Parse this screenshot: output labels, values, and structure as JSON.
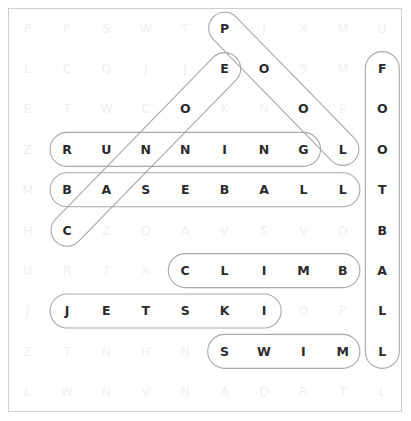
{
  "puzzle": {
    "type": "word-search",
    "rows": 10,
    "cols": 10,
    "grid": [
      [
        "P",
        "P",
        "S",
        "W",
        "T",
        "P",
        "I",
        "X",
        "M",
        "U"
      ],
      [
        "L",
        "C",
        "Q",
        "J",
        "J",
        "E",
        "O",
        "S",
        "M",
        "F"
      ],
      [
        "E",
        "T",
        "W",
        "C",
        "O",
        "K",
        "N",
        "O",
        "F",
        "O"
      ],
      [
        "Z",
        "R",
        "U",
        "N",
        "N",
        "I",
        "N",
        "G",
        "L",
        "O"
      ],
      [
        "M",
        "B",
        "A",
        "S",
        "E",
        "B",
        "A",
        "L",
        "L",
        "T"
      ],
      [
        "H",
        "C",
        "Z",
        "Q",
        "A",
        "V",
        "S",
        "V",
        "O",
        "B"
      ],
      [
        "U",
        "R",
        "T",
        "X",
        "C",
        "L",
        "I",
        "M",
        "B",
        "A"
      ],
      [
        "J",
        "J",
        "E",
        "T",
        "S",
        "K",
        "I",
        "O",
        "P",
        "L"
      ],
      [
        "Z",
        "T",
        "N",
        "H",
        "N",
        "S",
        "W",
        "I",
        "M",
        "L"
      ],
      [
        "L",
        "W",
        "N",
        "V",
        "N",
        "A",
        "D",
        "R",
        "T",
        "L"
      ]
    ],
    "found_words": [
      {
        "word": "POOL",
        "direction": "diagonal-down-right",
        "start": {
          "row": 0,
          "col": 5
        },
        "end": {
          "row": 3,
          "col": 8
        },
        "cells": [
          [
            0,
            5
          ],
          [
            1,
            6
          ],
          [
            2,
            7
          ],
          [
            3,
            8
          ]
        ]
      },
      {
        "word": "CANOE",
        "direction": "diagonal-up-right",
        "start": {
          "row": 5,
          "col": 1
        },
        "end": {
          "row": 1,
          "col": 5
        },
        "cells": [
          [
            5,
            1
          ],
          [
            4,
            2
          ],
          [
            3,
            3
          ],
          [
            2,
            4
          ],
          [
            1,
            5
          ]
        ]
      },
      {
        "word": "RUNNING",
        "direction": "horizontal-right",
        "start": {
          "row": 3,
          "col": 1
        },
        "end": {
          "row": 3,
          "col": 7
        },
        "cells": [
          [
            3,
            1
          ],
          [
            3,
            2
          ],
          [
            3,
            3
          ],
          [
            3,
            4
          ],
          [
            3,
            5
          ],
          [
            3,
            6
          ],
          [
            3,
            7
          ]
        ]
      },
      {
        "word": "BASEBALL",
        "direction": "horizontal-right",
        "start": {
          "row": 4,
          "col": 1
        },
        "end": {
          "row": 4,
          "col": 8
        },
        "cells": [
          [
            4,
            1
          ],
          [
            4,
            2
          ],
          [
            4,
            3
          ],
          [
            4,
            4
          ],
          [
            4,
            5
          ],
          [
            4,
            6
          ],
          [
            4,
            7
          ],
          [
            4,
            8
          ]
        ]
      },
      {
        "word": "CLIMB",
        "direction": "horizontal-right",
        "start": {
          "row": 6,
          "col": 4
        },
        "end": {
          "row": 6,
          "col": 8
        },
        "cells": [
          [
            6,
            4
          ],
          [
            6,
            5
          ],
          [
            6,
            6
          ],
          [
            6,
            7
          ],
          [
            6,
            8
          ]
        ]
      },
      {
        "word": "JETSKI",
        "direction": "horizontal-right",
        "start": {
          "row": 7,
          "col": 1
        },
        "end": {
          "row": 7,
          "col": 6
        },
        "cells": [
          [
            7,
            1
          ],
          [
            7,
            2
          ],
          [
            7,
            3
          ],
          [
            7,
            4
          ],
          [
            7,
            5
          ],
          [
            7,
            6
          ]
        ]
      },
      {
        "word": "SWIM",
        "direction": "horizontal-right",
        "start": {
          "row": 8,
          "col": 5
        },
        "end": {
          "row": 8,
          "col": 8
        },
        "cells": [
          [
            8,
            5
          ],
          [
            8,
            6
          ],
          [
            8,
            7
          ],
          [
            8,
            8
          ]
        ]
      },
      {
        "word": "FOOTBALL",
        "direction": "vertical-down",
        "start": {
          "row": 1,
          "col": 9
        },
        "end": {
          "row": 8,
          "col": 9
        },
        "cells": [
          [
            1,
            9
          ],
          [
            2,
            9
          ],
          [
            3,
            9
          ],
          [
            4,
            9
          ],
          [
            5,
            9
          ],
          [
            6,
            9
          ],
          [
            7,
            9
          ],
          [
            8,
            9
          ]
        ]
      }
    ],
    "colors": {
      "found_letter": "#2b2b2b",
      "unfound_letter": "#efefef",
      "marker_stroke": "#a8a8a8",
      "frame_border": "#cfcfcf",
      "background": "#ffffff"
    }
  }
}
